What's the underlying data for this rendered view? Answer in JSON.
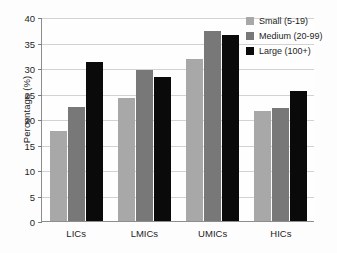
{
  "chart_data": {
    "type": "bar",
    "title": "",
    "xlabel": "",
    "ylabel": "Percentage (%)",
    "categories": [
      "LICs",
      "LMICs",
      "UMICs",
      "HICs"
    ],
    "series": [
      {
        "name": "Small (5-19)",
        "color": "#a8a8a8",
        "values": [
          17.7,
          24.1,
          31.8,
          21.5
        ]
      },
      {
        "name": "Medium (20-99)",
        "color": "#787878",
        "values": [
          22.4,
          29.6,
          37.2,
          22.1
        ]
      },
      {
        "name": "Large (100+)",
        "color": "#0a0a0a",
        "values": [
          31.2,
          28.2,
          36.5,
          25.4
        ]
      }
    ],
    "ylim": [
      0,
      40
    ],
    "yticks": [
      0,
      5,
      10,
      15,
      20,
      25,
      30,
      35,
      40
    ],
    "ytick_labels": [
      "0",
      "5",
      "10",
      "15",
      "20",
      "25",
      "30",
      "35",
      "40"
    ],
    "grid": true,
    "legend_position": "top-right",
    "axis_color": "#8d8d8d",
    "grid_color": "#d2d2d2",
    "background": "#fdfdfd"
  }
}
